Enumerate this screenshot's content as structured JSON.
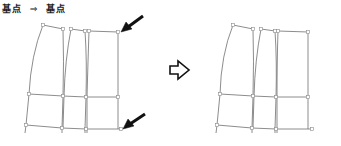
{
  "caption": {
    "from_label": "基点",
    "arrow_glyph": "⇒",
    "to_label": "基点"
  },
  "colors": {
    "line": "#6e6e6e",
    "point": "#8a8a8a",
    "arrow": "#111111"
  },
  "diagram": {
    "transition_arrow": "hollow-right-arrow",
    "before": {
      "label": "before",
      "pointer_arrows": [
        "top-right-base-point",
        "bottom-right-base-point"
      ]
    },
    "after": {
      "label": "after"
    }
  }
}
